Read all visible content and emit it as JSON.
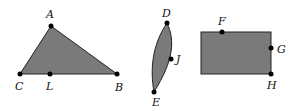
{
  "shapes": {
    "triangle": {
      "fill": "#7a7a7a",
      "vertices": {
        "A": [
          51,
          26
        ],
        "C": [
          20,
          74
        ],
        "B": [
          117,
          74
        ]
      },
      "points": {
        "L": [
          50,
          74
        ]
      },
      "labels": {
        "A": "A",
        "C": "C",
        "L": "L",
        "B": "B"
      }
    },
    "lens": {
      "fill": "#7a7a7a",
      "points": {
        "D": [
          167,
          23
        ],
        "E": [
          154,
          92
        ],
        "J": [
          171,
          59
        ]
      },
      "labels": {
        "D": "D",
        "E": "E",
        "J": "J"
      }
    },
    "rectangle": {
      "fill": "#7a7a7a",
      "x": 201,
      "y": 32,
      "width": 70,
      "height": 42,
      "points": {
        "F": [
          222,
          32
        ],
        "G": [
          271,
          48
        ],
        "H": [
          271,
          74
        ]
      },
      "labels": {
        "F": "F",
        "G": "G",
        "H": "H"
      }
    }
  }
}
